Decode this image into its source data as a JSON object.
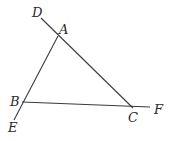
{
  "diagram": {
    "type": "triangle-with-extended-sides",
    "points": {
      "A": {
        "x": 58,
        "y": 36
      },
      "B": {
        "x": 22,
        "y": 102
      },
      "C": {
        "x": 133,
        "y": 108
      },
      "D": {
        "x": 41,
        "y": 18
      },
      "E": {
        "x": 14,
        "y": 120
      },
      "F": {
        "x": 150,
        "y": 107
      }
    },
    "labels": {
      "A": "A",
      "B": "B",
      "C": "C",
      "D": "D",
      "E": "E",
      "F": "F"
    },
    "segments": [
      {
        "from": "D",
        "to": "C",
        "note": "line through A and C extended past A to D"
      },
      {
        "from": "A",
        "to": "E",
        "note": "line through A and B extended past B to E"
      },
      {
        "from": "B",
        "to": "F",
        "note": "line through B and C extended past C to F"
      }
    ],
    "colors": {
      "stroke": "#3a3a3a",
      "text": "#2a2a2a",
      "background": "#ffffff"
    }
  }
}
